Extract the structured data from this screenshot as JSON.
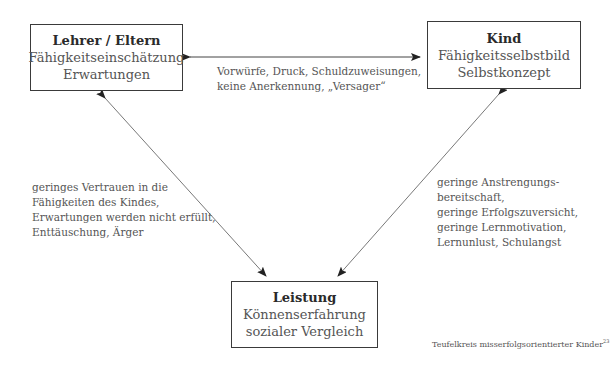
{
  "nodes": {
    "teachers_parents": {
      "title": "Lehrer / Eltern",
      "lines": [
        "Fähigkeitseinschätzung",
        "Erwartungen"
      ]
    },
    "child": {
      "title": "Kind",
      "lines": [
        "Fähigkeitsselbstbild",
        "Selbstkonzept"
      ]
    },
    "performance": {
      "title": "Leistung",
      "lines": [
        "Könnenserfahrung",
        "sozialer Vergleich"
      ]
    }
  },
  "edges": {
    "teachers_child": {
      "lines": [
        "Vorwürfe, Druck, Schuldzuweisungen,",
        "keine Anerkennung, „Versager“"
      ]
    },
    "teachers_performance": {
      "lines": [
        "geringes Vertrauen in die",
        "Fähigkeiten des Kindes,",
        "Erwartungen werden nicht erfüllt,",
        "Enttäuschung, Ärger"
      ]
    },
    "child_performance": {
      "lines": [
        "geringe Anstrengungs-",
        "bereitschaft,",
        "geringe Erfolgszuversicht,",
        "geringe Lernmotivation,",
        "Lernunlust, Schulangst"
      ]
    }
  },
  "caption": {
    "text": "Teufelkreis misserfolgsorientierter Kinder",
    "footnote": "23"
  }
}
